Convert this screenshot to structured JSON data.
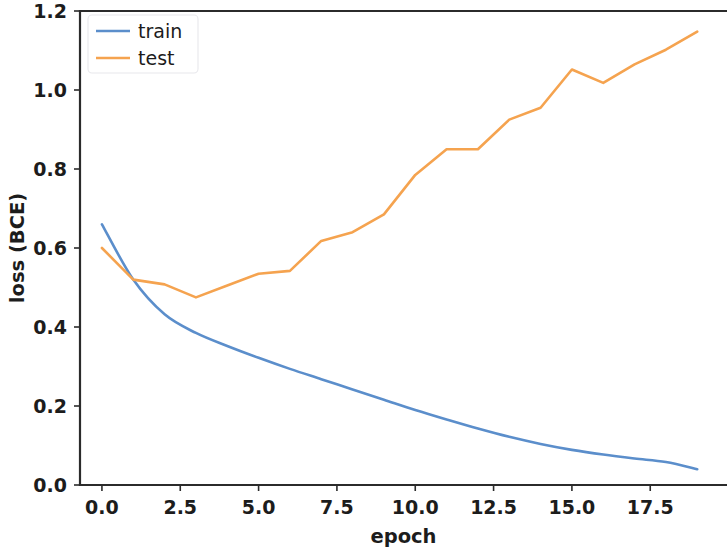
{
  "chart_data": {
    "type": "line",
    "title": "",
    "xlabel": "epoch",
    "ylabel": "loss (BCE)",
    "xlim": [
      -0.7,
      19.95
    ],
    "ylim": [
      0.0,
      1.2
    ],
    "grid": false,
    "legend_position": "upper left",
    "xticks": [
      "0.0",
      "2.5",
      "5.0",
      "7.5",
      "10.0",
      "12.5",
      "15.0",
      "17.5"
    ],
    "xtick_values": [
      0.0,
      2.5,
      5.0,
      7.5,
      10.0,
      12.5,
      15.0,
      17.5
    ],
    "yticks": [
      "0.0",
      "0.2",
      "0.4",
      "0.6",
      "0.8",
      "1.0",
      "1.2"
    ],
    "ytick_values": [
      0.0,
      0.2,
      0.4,
      0.6,
      0.8,
      1.0,
      1.2
    ],
    "x": [
      0,
      1,
      2,
      3,
      4,
      5,
      6,
      7,
      8,
      9,
      10,
      11,
      12,
      13,
      14,
      15,
      16,
      17,
      18,
      19
    ],
    "series": [
      {
        "name": "train",
        "color": "#5b8ecb",
        "values": [
          0.66,
          0.52,
          0.432,
          0.385,
          0.352,
          0.322,
          0.294,
          0.268,
          0.242,
          0.216,
          0.19,
          0.166,
          0.143,
          0.122,
          0.104,
          0.089,
          0.077,
          0.067,
          0.058,
          0.04
        ]
      },
      {
        "name": "test",
        "color": "#f5a34f",
        "values": [
          0.6,
          0.52,
          0.508,
          0.475,
          0.505,
          0.535,
          0.542,
          0.618,
          0.64,
          0.685,
          0.785,
          0.85,
          0.85,
          0.925,
          0.955,
          1.052,
          1.018,
          1.065,
          1.102,
          1.148
        ]
      }
    ]
  },
  "legend": {
    "entries": [
      {
        "label": "train"
      },
      {
        "label": "test"
      }
    ]
  },
  "colors": {
    "train": "#5b8ecb",
    "test": "#f5a34f",
    "axis": "#2b2b2b",
    "background": "#ffffff"
  }
}
